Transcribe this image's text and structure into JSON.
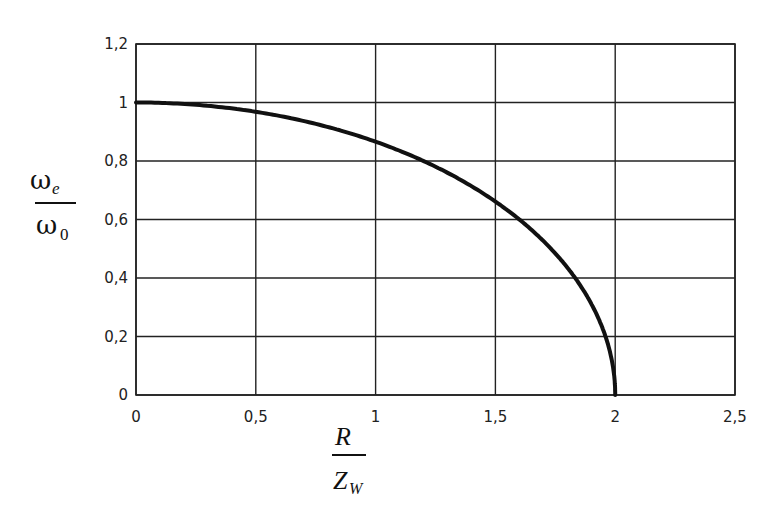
{
  "chart_data": {
    "type": "line",
    "title": "",
    "xlabel": "R / Z_W",
    "ylabel": "ω_e / ω_0",
    "xlim": [
      0,
      2.5
    ],
    "ylim": [
      0,
      1.2
    ],
    "grid": true,
    "legend": null,
    "x_ticks": [
      "0",
      "0,5",
      "1",
      "1,5",
      "2",
      "2,5"
    ],
    "y_ticks": [
      "0",
      "0,2",
      "0,4",
      "0,6",
      "0,8",
      "1",
      "1,2"
    ],
    "series": [
      {
        "name": "ω_e/ω_0",
        "x": [
          0,
          0.1,
          0.2,
          0.3,
          0.4,
          0.5,
          0.6,
          0.7,
          0.8,
          0.9,
          1.0,
          1.1,
          1.2,
          1.3,
          1.4,
          1.5,
          1.6,
          1.7,
          1.8,
          1.85,
          1.9,
          1.95,
          1.98,
          2.0
        ],
        "y": [
          1.0,
          0.999,
          0.995,
          0.989,
          0.98,
          0.968,
          0.954,
          0.937,
          0.917,
          0.893,
          0.866,
          0.835,
          0.8,
          0.76,
          0.714,
          0.661,
          0.6,
          0.527,
          0.436,
          0.38,
          0.312,
          0.222,
          0.141,
          0.0
        ],
        "color": "#111111"
      }
    ]
  },
  "labels": {
    "y_num": "ω",
    "y_num_sub": "e",
    "y_den": "ω",
    "y_den_sub": "0",
    "x_num": "R",
    "x_den": "Z",
    "x_den_sub": "W"
  }
}
